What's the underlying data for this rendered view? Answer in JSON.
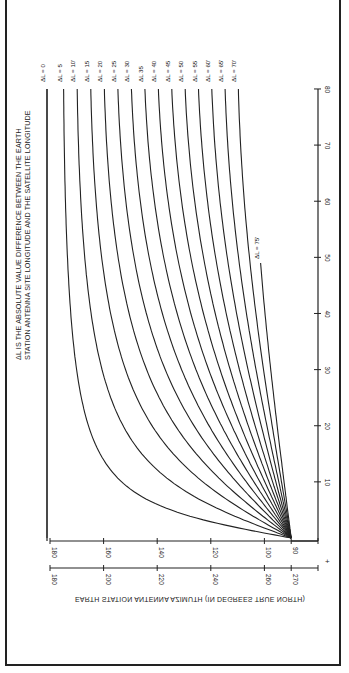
{
  "chart_data": {
    "type": "line",
    "orientation": "rotated-90-clockwise",
    "title": "",
    "note": [
      "ΔL IS THE ABSOLUTE VALUE DIFFERENCE BETWEEN THE EARTH",
      "STATION ANTENNA SITE LONGITUDE AND THE SATELLITE LONGITUDE"
    ],
    "xlabel": "EARTH STATION ANTENNA AZIMUTH (IN DEGREES TRUE NORTH)",
    "ylabel": "",
    "azimuth_axis_1": {
      "ticks": [
        180,
        160,
        140,
        120,
        100,
        90
      ]
    },
    "azimuth_axis_2": {
      "ticks": [
        180,
        200,
        220,
        240,
        260,
        270
      ]
    },
    "latitude_axis": {
      "ticks": [
        10,
        20,
        30,
        40,
        50,
        60,
        70,
        80
      ],
      "range": [
        0,
        80
      ]
    },
    "plus_marker": "+",
    "latitudes": [
      0.5,
      1,
      2,
      3,
      5,
      7.5,
      10,
      15,
      20,
      25,
      30,
      40,
      50,
      60,
      70,
      80
    ],
    "series": [
      {
        "name": "ΔL = 0",
        "label": "ΔL = 0",
        "dL": 0
      },
      {
        "name": "ΔL = 5",
        "label": "ΔL = 5",
        "dL": 5
      },
      {
        "name": "ΔL = 10",
        "label": "ΔL = 10'",
        "dL": 10
      },
      {
        "name": "ΔL = 15",
        "label": "ΔL = 15",
        "dL": 15
      },
      {
        "name": "ΔL = 20",
        "label": "ΔL = 20",
        "dL": 20
      },
      {
        "name": "ΔL = 25",
        "label": "ΔL = 25",
        "dL": 25
      },
      {
        "name": "ΔL = 30",
        "label": "ΔL = 30",
        "dL": 30
      },
      {
        "name": "ΔL = 35",
        "label": "ΔL   35",
        "dL": 35
      },
      {
        "name": "ΔL = 40",
        "label": "ΔL = 40",
        "dL": 40
      },
      {
        "name": "ΔL = 45",
        "label": "ΔL = 45",
        "dL": 45
      },
      {
        "name": "ΔL = 50",
        "label": "ΔL = 50",
        "dL": 50
      },
      {
        "name": "ΔL = 55",
        "label": "ΔL = 55",
        "dL": 55
      },
      {
        "name": "ΔL = 60",
        "label": "ΔL = 60'",
        "dL": 60
      },
      {
        "name": "ΔL = 65",
        "label": "ΔL = 65'",
        "dL": 65
      },
      {
        "name": "ΔL = 70",
        "label": "ΔL = 70'",
        "dL": 70
      },
      {
        "name": "ΔL = 75",
        "label": "ΔL = 75'",
        "dL": 75,
        "lat_max": 49
      }
    ],
    "sample_values_at_lat_80": {
      "0": 180,
      "10": 169.8,
      "20": 159.7,
      "30": 149.6,
      "40": 139.6,
      "50": 129.7,
      "60": 119.6,
      "70": 109.7
    },
    "grid": false,
    "legend": "inline labels at curve ends"
  }
}
